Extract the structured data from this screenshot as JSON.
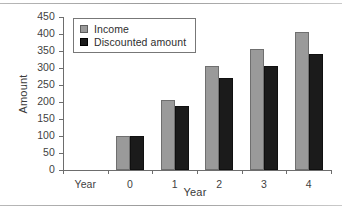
{
  "chart_data": {
    "type": "bar",
    "title": "",
    "xlabel": "Year",
    "ylabel": "Amount",
    "categories": [
      "Year",
      "0",
      "1",
      "2",
      "3",
      "4"
    ],
    "ylim": [
      0,
      450
    ],
    "yticks": [
      0,
      50,
      100,
      150,
      200,
      250,
      300,
      350,
      400,
      450
    ],
    "ytick_labels": [
      "0",
      "50",
      "100",
      "150",
      "200",
      "250",
      "300",
      "350",
      "400",
      "450"
    ],
    "grid": false,
    "legend_position": "upper left",
    "series": [
      {
        "name": "Income",
        "color": "#9a9a9a",
        "values": [
          null,
          100,
          205,
          305,
          357,
          407
        ]
      },
      {
        "name": "Discounted amount",
        "color": "#1b1b1b",
        "values": [
          null,
          99,
          188,
          272,
          305,
          340
        ]
      }
    ]
  },
  "legend": {
    "items": [
      {
        "label": "Income",
        "swatch": "income-swatch"
      },
      {
        "label": "Discounted amount",
        "swatch": "discounted-swatch"
      }
    ]
  }
}
